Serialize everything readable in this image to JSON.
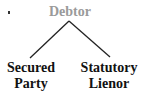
{
  "diagram": {
    "type": "tree",
    "root": {
      "label": "Debtor",
      "color": "#9a9a9a"
    },
    "children": [
      {
        "id": "secured-party",
        "lines": [
          "Secured",
          "Party"
        ],
        "color": "#111111"
      },
      {
        "id": "statutory-lienor",
        "lines": [
          "Statutory",
          "Lienor"
        ],
        "color": "#111111"
      }
    ],
    "edges": [
      {
        "from": "Debtor",
        "to": "Secured Party"
      },
      {
        "from": "Debtor",
        "to": "Statutory Lienor"
      }
    ],
    "edge_color": "#222222"
  }
}
